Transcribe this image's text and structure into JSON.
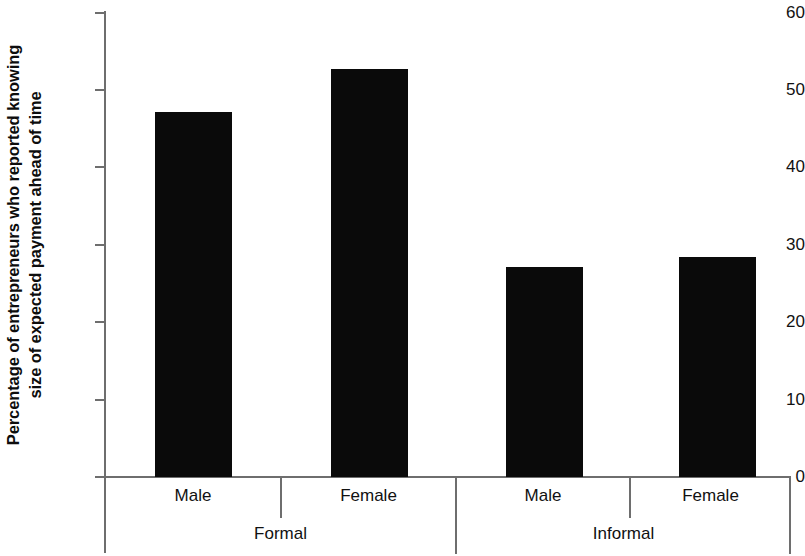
{
  "chart_data": {
    "type": "bar",
    "title": "",
    "subtitle": "",
    "xlabel": "",
    "ylabel": "Percentage of entrepreneurs who reported knowing size of expected payment ahead of time",
    "ylabel_line1": "Percentage of entrepreneurs who reported knowing",
    "ylabel_line2": "size of expected payment ahead of time",
    "ylim": [
      0,
      60
    ],
    "yticks": [
      0,
      10,
      20,
      30,
      40,
      50,
      60
    ],
    "ytick_labels": [
      "0",
      "10",
      "20",
      "30",
      "40",
      "50",
      "60"
    ],
    "grid": false,
    "legend": "none",
    "bar_color": "#0a0a0a",
    "axis_color": "#6e6e6e",
    "categories": [
      "Male",
      "Female",
      "Male",
      "Female"
    ],
    "groups": [
      "Formal",
      "Informal"
    ],
    "group_spans": [
      2,
      2
    ],
    "values": [
      47,
      52.5,
      27,
      28.3
    ],
    "series": [
      {
        "name": "Percentage knowing size of expected payment ahead of time",
        "values": [
          47,
          52.5,
          27,
          28.3
        ]
      }
    ],
    "bars": [
      {
        "group": "Formal",
        "category": "Male",
        "value": 47
      },
      {
        "group": "Formal",
        "category": "Female",
        "value": 52.5
      },
      {
        "group": "Informal",
        "category": "Male",
        "value": 27
      },
      {
        "group": "Informal",
        "category": "Female",
        "value": 28.3
      }
    ]
  }
}
